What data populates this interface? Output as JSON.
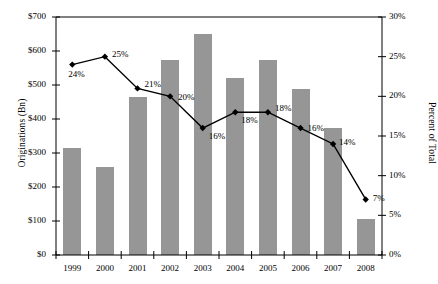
{
  "chart_data": {
    "type": "bar",
    "title": "",
    "subtitle": "",
    "xlabel": "",
    "ylabel": "Originations (Bn)",
    "y2label": "Percent of Total",
    "categories": [
      "1999",
      "2000",
      "2001",
      "2002",
      "2003",
      "2004",
      "2005",
      "2006",
      "2007",
      "2008"
    ],
    "ylim": [
      0,
      700
    ],
    "y2lim": [
      0,
      30
    ],
    "yticks": [
      "$0",
      "$100",
      "$200",
      "$300",
      "$400",
      "$500",
      "$600",
      "$700"
    ],
    "ytick_values": [
      0,
      100,
      200,
      300,
      400,
      500,
      600,
      700
    ],
    "y2ticks": [
      "0%",
      "5%",
      "10%",
      "15%",
      "20%",
      "25%",
      "30%"
    ],
    "y2tick_values": [
      0,
      5,
      10,
      15,
      20,
      25,
      30
    ],
    "grid": false,
    "legend": "none",
    "series": [
      {
        "name": "Originations (Bn)",
        "type": "bar",
        "axis": "left",
        "color": "#969696",
        "values": [
          315,
          260,
          465,
          573,
          650,
          520,
          573,
          487,
          375,
          105
        ]
      },
      {
        "name": "Percent of Total",
        "type": "line",
        "axis": "right",
        "color": "#000000",
        "marker": "diamond",
        "values": [
          24,
          25,
          21,
          20,
          16,
          18,
          18,
          16,
          14,
          7
        ],
        "data_labels": [
          "24%",
          "25%",
          "21%",
          "20%",
          "16%",
          "18%",
          "18%",
          "16%",
          "14%",
          "7%"
        ]
      }
    ]
  },
  "axes": {
    "left_title": "Originations (Bn)",
    "right_title": "Percent of Total"
  }
}
